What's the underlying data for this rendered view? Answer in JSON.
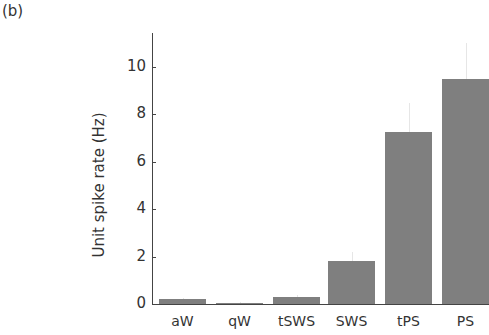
{
  "panel_label": "(b)",
  "chart_data": {
    "type": "bar",
    "title": "",
    "xlabel": "",
    "ylabel": "Unit spike rate (Hz)",
    "categories": [
      "aW",
      "qW",
      "tSWS",
      "SWS",
      "tPS",
      "PS"
    ],
    "values": [
      0.2,
      0.05,
      0.3,
      1.8,
      7.25,
      9.5
    ],
    "error_upper": [
      0.25,
      0.08,
      0.4,
      2.2,
      8.5,
      11.0
    ],
    "ylim": [
      0,
      11.5
    ],
    "yticks": [
      "0",
      "2",
      "4",
      "6",
      "8",
      "10"
    ],
    "bar_color": "#7f7f7f",
    "grid": false,
    "legend": null
  }
}
